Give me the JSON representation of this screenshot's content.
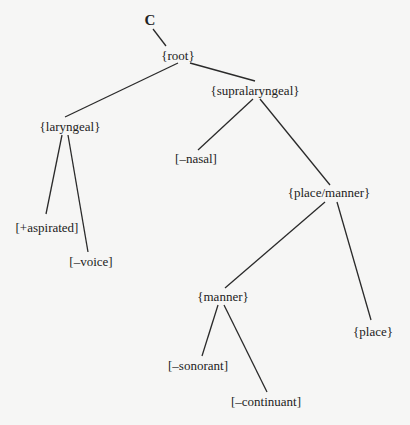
{
  "diagram": {
    "type": "feature-geometry-tree",
    "background": "#f6f6f5",
    "line_color": "#2a2a2a",
    "text_color": "#222222",
    "nodes": [
      {
        "id": "c",
        "label": "C",
        "x": 150,
        "y": 20
      },
      {
        "id": "root",
        "label": "{root}",
        "x": 178,
        "y": 56
      },
      {
        "id": "laryngeal",
        "label": "{laryngeal}",
        "x": 70,
        "y": 127
      },
      {
        "id": "supralaryngeal",
        "label": "{supralaryngeal}",
        "x": 255,
        "y": 91
      },
      {
        "id": "aspirated",
        "label": "[+aspirated]",
        "x": 47,
        "y": 228
      },
      {
        "id": "voice",
        "label": "[–voice]",
        "x": 91,
        "y": 262
      },
      {
        "id": "nasal",
        "label": "[–nasal]",
        "x": 196,
        "y": 159
      },
      {
        "id": "place_manner",
        "label": "{place/manner}",
        "x": 329,
        "y": 193
      },
      {
        "id": "manner",
        "label": "{manner}",
        "x": 223,
        "y": 297
      },
      {
        "id": "place",
        "label": "{place}",
        "x": 373,
        "y": 332
      },
      {
        "id": "sonorant",
        "label": "[–sonorant]",
        "x": 198,
        "y": 366
      },
      {
        "id": "continuant",
        "label": "[–continuant]",
        "x": 266,
        "y": 402
      }
    ],
    "edges": [
      {
        "from": "c",
        "to": "root",
        "x1": 153,
        "y1": 29,
        "x2": 166,
        "y2": 46
      },
      {
        "from": "root",
        "to": "laryngeal",
        "x1": 178,
        "y1": 63,
        "x2": 65,
        "y2": 117
      },
      {
        "from": "root",
        "to": "supralaryngeal",
        "x1": 190,
        "y1": 63,
        "x2": 255,
        "y2": 81
      },
      {
        "from": "laryngeal",
        "to": "aspirated",
        "x1": 62,
        "y1": 135,
        "x2": 46,
        "y2": 214
      },
      {
        "from": "laryngeal",
        "to": "voice",
        "x1": 68,
        "y1": 135,
        "x2": 88,
        "y2": 252
      },
      {
        "from": "supralaryngeal",
        "to": "nasal",
        "x1": 253,
        "y1": 99,
        "x2": 198,
        "y2": 150
      },
      {
        "from": "supralaryngeal",
        "to": "place_manner",
        "x1": 260,
        "y1": 99,
        "x2": 330,
        "y2": 185
      },
      {
        "from": "place_manner",
        "to": "manner",
        "x1": 325,
        "y1": 202,
        "x2": 225,
        "y2": 288
      },
      {
        "from": "place_manner",
        "to": "place",
        "x1": 337,
        "y1": 202,
        "x2": 371,
        "y2": 320
      },
      {
        "from": "manner",
        "to": "sonorant",
        "x1": 218,
        "y1": 305,
        "x2": 202,
        "y2": 356
      },
      {
        "from": "manner",
        "to": "continuant",
        "x1": 224,
        "y1": 305,
        "x2": 267,
        "y2": 392
      }
    ]
  }
}
